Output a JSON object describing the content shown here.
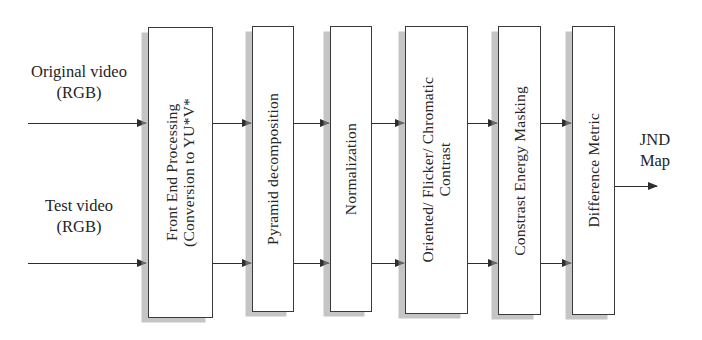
{
  "diagram": {
    "background_color": "#ffffff",
    "line_color": "#2e2e2e",
    "box_border_color": "#3a3a3a",
    "shadow_color": "#969696",
    "inputs": [
      {
        "id": "original-video",
        "label": "Original video\n(RGB)"
      },
      {
        "id": "test-video",
        "label": "Test video\n(RGB)"
      }
    ],
    "stages": [
      {
        "id": "front-end-processing",
        "label": "Front End Processing\n(Conversion to YU*V*"
      },
      {
        "id": "pyramid-decomposition",
        "label": "Pyramid decomposition"
      },
      {
        "id": "normalization",
        "label": "Normalization"
      },
      {
        "id": "oriented-flicker-chromatic-contrast",
        "label": "Oriented/ Flicker/ Chromatic\nContrast"
      },
      {
        "id": "contrast-energy-masking",
        "label": "Constrast Energy Masking"
      },
      {
        "id": "difference-metric",
        "label": "Difference Metric"
      }
    ],
    "output": {
      "id": "jnd-map",
      "label": "JND\nMap"
    }
  }
}
